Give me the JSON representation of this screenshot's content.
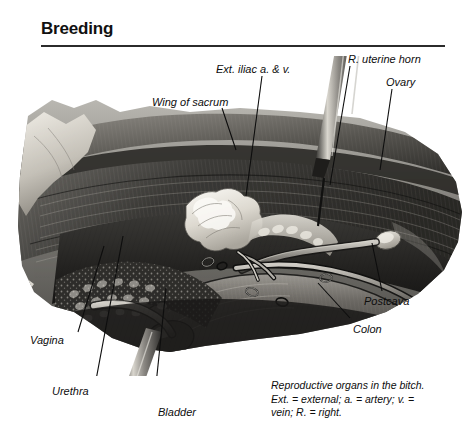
{
  "header": {
    "title": "Breeding"
  },
  "figure": {
    "name": "reproductive-organs-bitch-illustration",
    "media": "grayscale anatomical halftone illustration",
    "background": "#ffffff",
    "ink_dark": "#1b1b1b",
    "ink_mid": "#6e6e6e",
    "ink_light": "#c9c9c9",
    "highlight": "#f2f1ec"
  },
  "labels": [
    {
      "id": "wing-of-sacrum",
      "text": "Wing of sacrum",
      "x": 152,
      "y": 96,
      "leader": {
        "x1": 222,
        "y1": 108,
        "x2": 236,
        "y2": 150
      }
    },
    {
      "id": "ext-iliac",
      "text": "Ext. iliac a. & v.",
      "x": 216,
      "y": 63,
      "leader": {
        "x1": 262,
        "y1": 76,
        "x2": 246,
        "y2": 196
      }
    },
    {
      "id": "r-uterine-horn",
      "text": "R. uterine horn",
      "x": 348,
      "y": 53,
      "leader": {
        "x1": 350,
        "y1": 66,
        "x2": 330,
        "y2": 185
      }
    },
    {
      "id": "ovary",
      "text": "Ovary",
      "x": 386,
      "y": 76,
      "leader": {
        "x1": 392,
        "y1": 89,
        "x2": 380,
        "y2": 170
      }
    },
    {
      "id": "postcava",
      "text": "Postcava",
      "x": 364,
      "y": 295,
      "leader": {
        "x1": 382,
        "y1": 291,
        "x2": 372,
        "y2": 243
      }
    },
    {
      "id": "colon",
      "text": "Colon",
      "x": 353,
      "y": 323,
      "leader": {
        "x1": 350,
        "y1": 318,
        "x2": 318,
        "y2": 283
      }
    },
    {
      "id": "vagina",
      "text": "Vagina",
      "x": 30,
      "y": 334,
      "leader": {
        "x1": 78,
        "y1": 332,
        "x2": 104,
        "y2": 246
      }
    },
    {
      "id": "urethra",
      "text": "Urethra",
      "x": 52,
      "y": 385,
      "leader": {
        "x1": 96,
        "y1": 380,
        "x2": 123,
        "y2": 236
      }
    },
    {
      "id": "bladder",
      "text": "Bladder",
      "x": 158,
      "y": 406,
      "leader": {
        "x1": 154,
        "y1": 404,
        "x2": 166,
        "y2": 288
      }
    }
  ],
  "caption": {
    "line1": "Reproductive organs in the bitch.",
    "line2": "Ext. = external; a. = artery; v. =",
    "line3": "vein; R. = right."
  }
}
